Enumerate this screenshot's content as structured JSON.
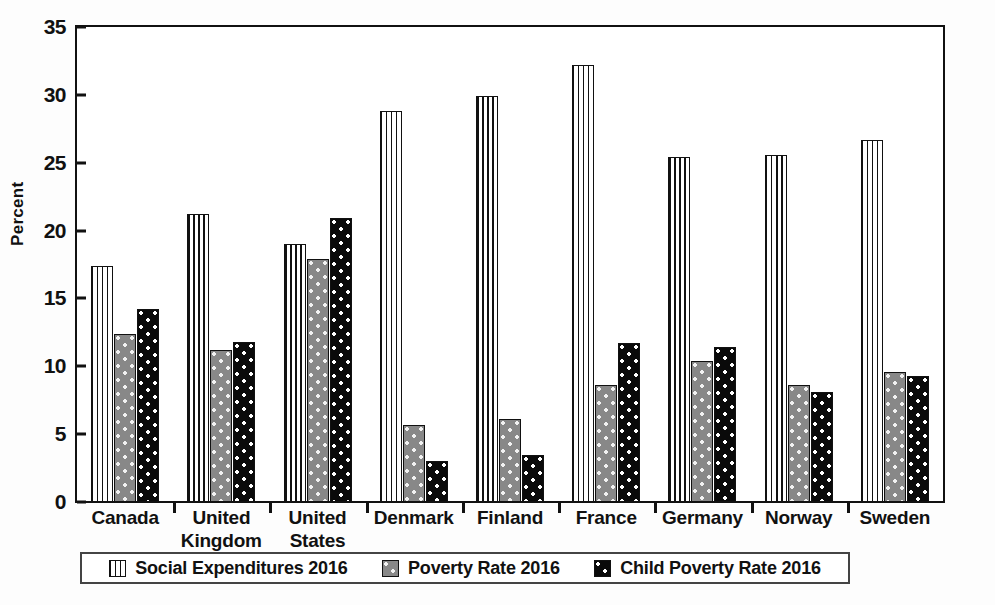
{
  "chart_data": {
    "type": "bar",
    "title": "",
    "xlabel": "",
    "ylabel": "Percent",
    "ylim": [
      0,
      35
    ],
    "yticks": [
      0,
      5,
      10,
      15,
      20,
      25,
      30,
      35
    ],
    "grid": false,
    "legend_position": "bottom",
    "categories": [
      "Canada",
      "United Kingdom",
      "United States",
      "Denmark",
      "Finland",
      "France",
      "Germany",
      "Norway",
      "Sweden"
    ],
    "category_lines": [
      [
        "Canada"
      ],
      [
        "United",
        "Kingdom"
      ],
      [
        "United",
        "States"
      ],
      [
        "Denmark"
      ],
      [
        "Finland"
      ],
      [
        "France"
      ],
      [
        "Germany"
      ],
      [
        "Norway"
      ],
      [
        "Sweden"
      ]
    ],
    "series": [
      {
        "name": "Social Expenditures 2016",
        "pattern": "vertical-stripes",
        "color": "#ffffff",
        "values": [
          17.4,
          21.2,
          19.0,
          28.8,
          29.9,
          32.2,
          25.4,
          25.6,
          26.7
        ]
      },
      {
        "name": "Poverty Rate 2016",
        "pattern": "gray-dots",
        "color": "#888888",
        "values": [
          12.4,
          11.2,
          17.9,
          5.7,
          6.1,
          8.6,
          10.4,
          8.6,
          9.6
        ]
      },
      {
        "name": "Child Poverty Rate 2016",
        "pattern": "black-dots",
        "color": "#0a0a0a",
        "values": [
          14.2,
          11.8,
          20.9,
          3.0,
          3.5,
          11.7,
          11.4,
          8.1,
          9.3
        ]
      }
    ]
  }
}
